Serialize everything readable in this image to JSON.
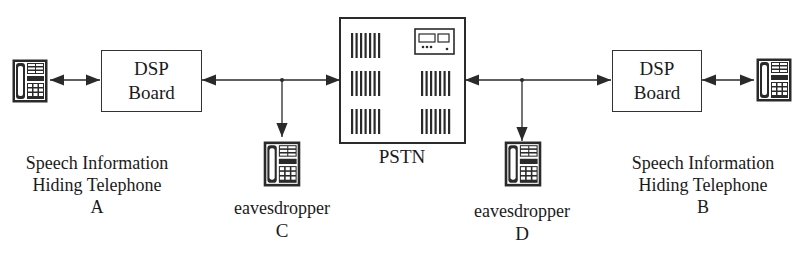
{
  "diagram": {
    "type": "network-topology",
    "colors": {
      "line": "#2a2a2a",
      "background": "#ffffff"
    },
    "nodes": {
      "phone_a": {
        "icon": "telephone-icon"
      },
      "dsp_a": {
        "line1": "DSP",
        "line2": "Board"
      },
      "pstn": {
        "icon": "switch-cabinet-icon",
        "label": "PSTN"
      },
      "dsp_b": {
        "line1": "DSP",
        "line2": "Board"
      },
      "phone_b": {
        "icon": "telephone-icon"
      },
      "eaves_c": {
        "icon": "telephone-icon",
        "label": "eavesdropper",
        "id": "C"
      },
      "eaves_d": {
        "icon": "telephone-icon",
        "label": "eavesdropper",
        "id": "D"
      }
    },
    "captions": {
      "a": {
        "line1": "Speech Information",
        "line2": "Hiding Telephone",
        "line3": "A"
      },
      "b": {
        "line1": "Speech Information",
        "line2": "Hiding Telephone",
        "line3": "B"
      }
    },
    "edges": [
      {
        "from": "phone_a",
        "to": "dsp_a",
        "style": "bidirectional"
      },
      {
        "from": "dsp_a",
        "to": "pstn",
        "style": "bidirectional",
        "tap": "eaves_c"
      },
      {
        "from": "pstn",
        "to": "dsp_b",
        "style": "bidirectional",
        "tap": "eaves_d"
      },
      {
        "from": "dsp_b",
        "to": "phone_b",
        "style": "bidirectional"
      }
    ]
  }
}
